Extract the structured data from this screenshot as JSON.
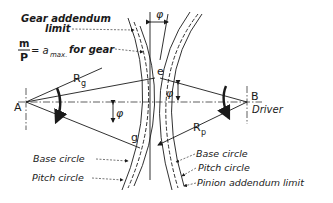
{
  "diagram": {
    "labels": {
      "gear_addendum_limit_1": "Gear addendum",
      "gear_addendum_limit_2": "limit",
      "ratio_num": "m",
      "ratio_den": "P",
      "ratio_rhs": "= a",
      "ratio_sub": "max.",
      "ratio_tail": "for gear",
      "point_a": "A",
      "point_b": "B",
      "driver": "Driver",
      "point_e": "e",
      "point_g": "g",
      "rg": "R",
      "rg_sub": "g",
      "rp": "R",
      "rp_sub": "p",
      "phi": "φ",
      "base_circle_left": "Base circle",
      "pitch_circle_left": "Pitch circle",
      "base_circle_right": "Base circle",
      "pitch_circle_right": "Pitch circle",
      "pinion_addendum_limit": "Pinion addendum limit"
    },
    "colors": {
      "ink": "#1a1a1a",
      "background": "#ffffff"
    }
  }
}
